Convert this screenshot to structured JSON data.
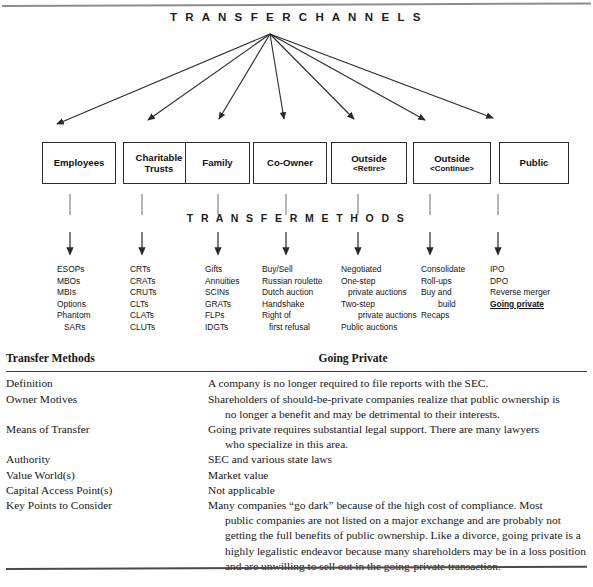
{
  "diagram": {
    "title": "T R A N S F E R   C H A N N E L S",
    "methods_title": "T R A N S F E R   M E T H O D S",
    "channels": [
      {
        "label": "Employees",
        "sub": ""
      },
      {
        "label": "Charitable",
        "sub": "Trusts"
      },
      {
        "label": "Family",
        "sub": ""
      },
      {
        "label": "Co-Owner",
        "sub": ""
      },
      {
        "label": "Outside",
        "sub": "<Retire>"
      },
      {
        "label": "Outside",
        "sub": "<Continue>"
      },
      {
        "label": "Public",
        "sub": ""
      }
    ],
    "method_columns": [
      {
        "items": [
          "ESOPs",
          "MBOs",
          "MBIs",
          "Options",
          "Phantom",
          " SARs"
        ]
      },
      {
        "items": [
          "CRTs",
          "CRATs",
          "CRUTs",
          "CLTs",
          "CLATs",
          "CLUTs"
        ]
      },
      {
        "items": [
          "Gifts",
          "Annuities",
          "SCINs",
          "GRATs",
          "FLPs",
          "IDGTs"
        ]
      },
      {
        "items": [
          "Buy/Sell",
          "Russian roulette",
          "Dutch auction",
          "Handshake",
          "Right of",
          " first refusal"
        ]
      },
      {
        "items": [
          "Negotiated",
          "One-step",
          " private auctions",
          "Two-step",
          " private auctions",
          "Public auctions"
        ]
      },
      {
        "items": [
          "Consolidate",
          "Roll-ups",
          "Buy and",
          " build",
          "Recaps"
        ]
      },
      {
        "items": [
          "IPO",
          "DPO",
          "Reverse merger",
          "Going private"
        ]
      }
    ],
    "highlighted_method": "Going private"
  },
  "table": {
    "header_left": "Transfer Methods",
    "header_right": "Going Private",
    "rows": [
      {
        "label": "Definition",
        "value": "A company is no longer required to file reports with the SEC.",
        "cont": ""
      },
      {
        "label": "Owner Motives",
        "value": "Shareholders of should-be-private companies realize that public ownership is",
        "cont": "no longer a benefit and may be detrimental to their interests."
      },
      {
        "label": "Means of Transfer",
        "value": "Going private requires substantial legal support. There are many lawyers",
        "cont": "who specialize in this area."
      },
      {
        "label": "Authority",
        "value": "SEC and various state laws",
        "cont": ""
      },
      {
        "label": "Value World(s)",
        "value": "Market value",
        "cont": ""
      },
      {
        "label": "Capital Access Point(s)",
        "value": "Not applicable",
        "cont": ""
      },
      {
        "label": "Key Points to Consider",
        "value": "Many companies “go dark” because of the high cost of compliance. Most",
        "cont": "public companies are not listed on a major exchange and are probably not getting the full benefits of public ownership. Like a divorce, going private is a highly legalistic endeavor because many shareholders may be in a loss position and are unwilling to sell out in the going-private transaction."
      }
    ]
  },
  "colors": {
    "ink": "#111111",
    "rule": "#4a4a4a",
    "top_rule": "#8d8d90",
    "box_border": "#2b2b2b"
  }
}
